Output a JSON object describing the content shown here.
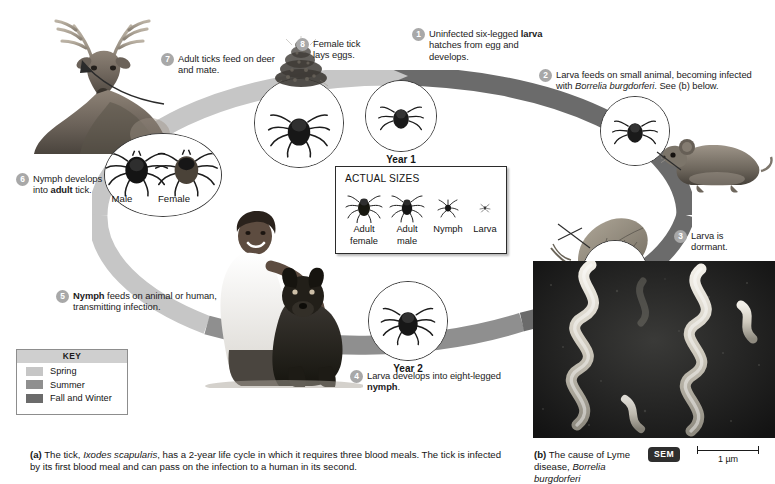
{
  "figure": {
    "year_labels": {
      "year1": "Year 1",
      "year2": "Year 2"
    },
    "tick_sex_labels": {
      "male": "Male",
      "female": "Female"
    }
  },
  "steps": [
    {
      "num": "1",
      "text_parts": [
        "Uninfected six-legged ",
        "larva",
        " hatches from egg and develops."
      ],
      "bold_index": 1
    },
    {
      "num": "2",
      "text_parts": [
        "Larva feeds on small animal, becoming infected with ",
        "Borrelia burgdorferi",
        ". See (b) below."
      ],
      "italic_index": 1
    },
    {
      "num": "3",
      "text_parts": [
        "Larva is dormant."
      ]
    },
    {
      "num": "4",
      "text_parts": [
        "Larva develops into eight-legged ",
        "nymph",
        "."
      ],
      "bold_index": 1
    },
    {
      "num": "5",
      "text_parts": [
        "Nymph",
        " feeds on animal or human, transmitting infection."
      ],
      "bold_index": 0
    },
    {
      "num": "6",
      "text_parts": [
        "Nymph develops into ",
        "adult",
        " tick."
      ],
      "bold_index": 1
    },
    {
      "num": "7",
      "text_parts": [
        "Adult ticks feed on deer and mate."
      ]
    },
    {
      "num": "8",
      "text_parts": [
        "Female tick lays eggs."
      ]
    }
  ],
  "actual_sizes": {
    "title": "ACTUAL SIZES",
    "items": [
      {
        "label_line1": "Adult",
        "label_line2": "female",
        "icon": "tick-adult-female-icon"
      },
      {
        "label_line1": "Adult",
        "label_line2": "male",
        "icon": "tick-adult-male-icon"
      },
      {
        "label_line1": "Nymph",
        "label_line2": "",
        "icon": "tick-nymph-icon"
      },
      {
        "label_line1": "Larva",
        "label_line2": "",
        "icon": "tick-larva-icon"
      }
    ]
  },
  "key": {
    "title": "KEY",
    "items": [
      {
        "label": "Spring",
        "color": "#c6c6c6"
      },
      {
        "label": "Summer",
        "color": "#8f8f8f"
      },
      {
        "label": "Fall and Winter",
        "color": "#6b6b6b"
      }
    ]
  },
  "captions": {
    "a": {
      "label": "(a)",
      "parts": [
        {
          "text": " The tick, ",
          "style": "normal"
        },
        {
          "text": "Ixodes scapularis",
          "style": "italic"
        },
        {
          "text": ", has a 2-year life cycle in which it requires three blood meals. The tick is infected by its first blood meal and can pass on the infection to a human in its second.",
          "style": "normal"
        }
      ]
    },
    "b": {
      "label": "(b)",
      "parts": [
        {
          "text": " The cause of Lyme disease, ",
          "style": "normal"
        },
        {
          "text": "Borrelia burgdorferi",
          "style": "italic"
        }
      ]
    }
  },
  "micrograph": {
    "badge": "SEM",
    "scale_value": "1 µm"
  },
  "colors": {
    "ring_spring": "#c6c6c6",
    "ring_summer": "#8f8f8f",
    "ring_fall_winter": "#6b6b6b",
    "step_badge": "#a8a8a8",
    "text": "#1b1b1b",
    "page_background": "#ffffff"
  }
}
